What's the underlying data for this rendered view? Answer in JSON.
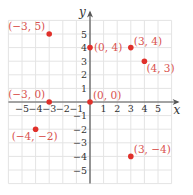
{
  "chart_data": {
    "type": "scatter",
    "title": "",
    "xlabel": "x",
    "ylabel": "y",
    "xlim": [
      -6,
      6
    ],
    "ylim": [
      -6,
      6
    ],
    "grid": true,
    "legend": "none",
    "x_ticks": [
      -5,
      -4,
      -3,
      -2,
      -1,
      1,
      2,
      3,
      4,
      5
    ],
    "y_ticks": [
      -5,
      -4,
      -3,
      -2,
      -1,
      1,
      2,
      3,
      4,
      5
    ],
    "points": [
      {
        "x": -3,
        "y": 5,
        "label": "(−3, 5)",
        "label_pos": "upper-left"
      },
      {
        "x": 0,
        "y": 4,
        "label": "(0, 4)",
        "label_pos": "right"
      },
      {
        "x": 3,
        "y": 4,
        "label": "(3, 4)",
        "label_pos": "upper-right"
      },
      {
        "x": 4,
        "y": 3,
        "label": "(4, 3)",
        "label_pos": "lower-right"
      },
      {
        "x": -3,
        "y": 0,
        "label": "(−3, 0)",
        "label_pos": "upper-left"
      },
      {
        "x": 0,
        "y": 0,
        "label": "(0, 0)",
        "label_pos": "upper-right"
      },
      {
        "x": -4,
        "y": -2,
        "label": "(−4, −2)",
        "label_pos": "below"
      },
      {
        "x": 3,
        "y": -4,
        "label": "(3, −4)",
        "label_pos": "upper-right"
      }
    ]
  },
  "colors": {
    "point": "#e0302a",
    "label": "#d9534f",
    "grid": "#e4e4e4",
    "axis": "#555555",
    "tick_text": "#333333"
  },
  "layout": {
    "origin_px": [
      90,
      102
    ],
    "unit_px": 13.6
  }
}
